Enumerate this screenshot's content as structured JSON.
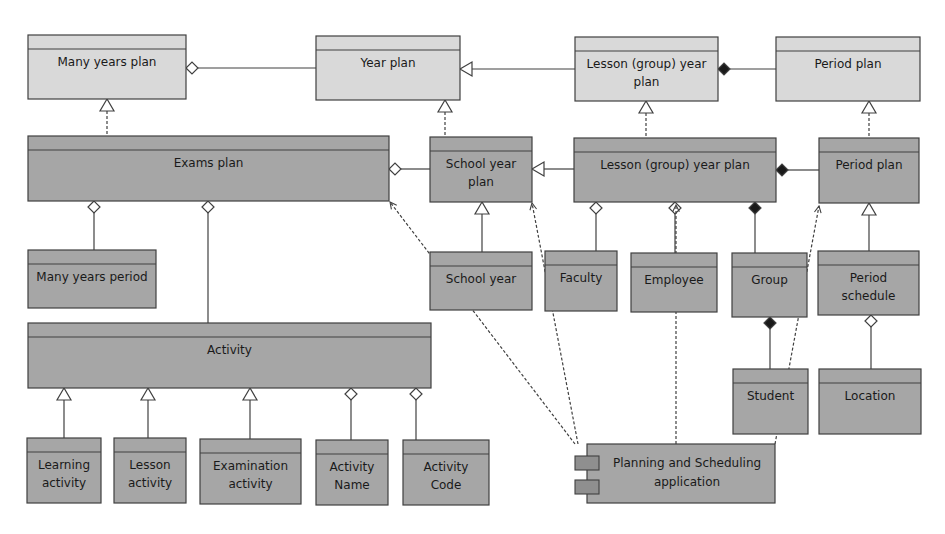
{
  "diagram": {
    "type": "UML class diagram",
    "colors": {
      "plan_fill": "#d9d9d9",
      "class_fill": "#a6a6a6",
      "stroke": "#404040",
      "background": "#ffffff"
    },
    "classes": [
      {
        "id": "many_years_plan",
        "label": [
          "Many years plan"
        ],
        "style": "plan"
      },
      {
        "id": "year_plan",
        "label": [
          "Year plan"
        ],
        "style": "plan"
      },
      {
        "id": "lesson_group_year_plan_abstract",
        "label": [
          "Lesson (group) year",
          "plan"
        ],
        "style": "plan"
      },
      {
        "id": "period_plan_abstract",
        "label": [
          "Period plan"
        ],
        "style": "plan"
      },
      {
        "id": "exams_plan",
        "label": [
          "Exams plan"
        ],
        "style": "class"
      },
      {
        "id": "school_year_plan",
        "label": [
          "School year",
          "plan"
        ],
        "style": "class"
      },
      {
        "id": "lesson_group_year_plan",
        "label": [
          "Lesson (group) year plan"
        ],
        "style": "class"
      },
      {
        "id": "period_plan",
        "label": [
          "Period plan"
        ],
        "style": "class"
      },
      {
        "id": "many_years_period",
        "label": [
          "Many years period"
        ],
        "style": "class"
      },
      {
        "id": "school_year",
        "label": [
          "School year"
        ],
        "style": "class"
      },
      {
        "id": "faculty",
        "label": [
          "Faculty"
        ],
        "style": "class"
      },
      {
        "id": "employee",
        "label": [
          "Employee"
        ],
        "style": "class"
      },
      {
        "id": "group",
        "label": [
          "Group"
        ],
        "style": "class"
      },
      {
        "id": "period_schedule",
        "label": [
          "Period",
          "schedule"
        ],
        "style": "class"
      },
      {
        "id": "activity",
        "label": [
          "Activity"
        ],
        "style": "class"
      },
      {
        "id": "student",
        "label": [
          "Student"
        ],
        "style": "class"
      },
      {
        "id": "location",
        "label": [
          "Location"
        ],
        "style": "class"
      },
      {
        "id": "learning_activity",
        "label": [
          "Learning",
          "activity"
        ],
        "style": "class"
      },
      {
        "id": "lesson_activity",
        "label": [
          "Lesson",
          "activity"
        ],
        "style": "class"
      },
      {
        "id": "examination_activity",
        "label": [
          "Examination",
          "activity"
        ],
        "style": "class"
      },
      {
        "id": "activity_name",
        "label": [
          "Activity",
          "Name"
        ],
        "style": "class"
      },
      {
        "id": "activity_code",
        "label": [
          "Activity",
          "Code"
        ],
        "style": "class"
      }
    ],
    "component": {
      "id": "planning_scheduling_app",
      "label": [
        "Planning and Scheduling",
        "application"
      ]
    },
    "relations": [
      {
        "from": "year_plan",
        "to": "many_years_plan",
        "kind": "aggregation"
      },
      {
        "from": "lesson_group_year_plan_abstract",
        "to": "year_plan",
        "kind": "generalization"
      },
      {
        "from": "period_plan_abstract",
        "to": "lesson_group_year_plan_abstract",
        "kind": "composition"
      },
      {
        "from": "exams_plan",
        "to": "many_years_plan",
        "kind": "realization"
      },
      {
        "from": "school_year_plan",
        "to": "year_plan",
        "kind": "realization"
      },
      {
        "from": "lesson_group_year_plan",
        "to": "lesson_group_year_plan_abstract",
        "kind": "realization"
      },
      {
        "from": "period_plan",
        "to": "period_plan_abstract",
        "kind": "realization"
      },
      {
        "from": "school_year_plan",
        "to": "exams_plan",
        "kind": "aggregation"
      },
      {
        "from": "lesson_group_year_plan",
        "to": "school_year_plan",
        "kind": "generalization"
      },
      {
        "from": "period_plan",
        "to": "lesson_group_year_plan",
        "kind": "composition"
      },
      {
        "from": "many_years_period",
        "to": "exams_plan",
        "kind": "aggregation"
      },
      {
        "from": "activity",
        "to": "exams_plan",
        "kind": "aggregation"
      },
      {
        "from": "school_year",
        "to": "school_year_plan",
        "kind": "generalization"
      },
      {
        "from": "faculty",
        "to": "lesson_group_year_plan",
        "kind": "aggregation"
      },
      {
        "from": "employee",
        "to": "lesson_group_year_plan",
        "kind": "aggregation"
      },
      {
        "from": "group",
        "to": "lesson_group_year_plan",
        "kind": "composition"
      },
      {
        "from": "period_schedule",
        "to": "period_plan",
        "kind": "generalization"
      },
      {
        "from": "student",
        "to": "group",
        "kind": "composition"
      },
      {
        "from": "location",
        "to": "period_schedule",
        "kind": "aggregation"
      },
      {
        "from": "learning_activity",
        "to": "activity",
        "kind": "generalization"
      },
      {
        "from": "lesson_activity",
        "to": "activity",
        "kind": "generalization"
      },
      {
        "from": "examination_activity",
        "to": "activity",
        "kind": "generalization"
      },
      {
        "from": "activity_name",
        "to": "activity",
        "kind": "aggregation"
      },
      {
        "from": "activity_code",
        "to": "activity",
        "kind": "aggregation"
      },
      {
        "from": "planning_scheduling_app",
        "to": "exams_plan",
        "kind": "dependency"
      },
      {
        "from": "planning_scheduling_app",
        "to": "school_year_plan",
        "kind": "dependency"
      },
      {
        "from": "planning_scheduling_app",
        "to": "lesson_group_year_plan",
        "kind": "dependency"
      },
      {
        "from": "planning_scheduling_app",
        "to": "period_plan",
        "kind": "dependency"
      }
    ]
  }
}
